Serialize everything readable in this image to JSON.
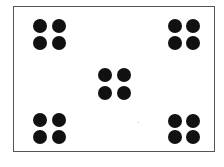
{
  "diagram": {
    "frame_color": "#555555",
    "dot_color": "#111111",
    "clusters": [
      {
        "name": "top-left",
        "dots": [
          [
            40,
            26
          ],
          [
            59,
            26
          ],
          [
            40,
            43
          ],
          [
            59,
            43
          ]
        ]
      },
      {
        "name": "top-right",
        "dots": [
          [
            175,
            26
          ],
          [
            193,
            26
          ],
          [
            175,
            43
          ],
          [
            193,
            43
          ]
        ]
      },
      {
        "name": "center",
        "dots": [
          [
            105,
            75
          ],
          [
            124,
            75
          ],
          [
            105,
            93
          ],
          [
            124,
            93
          ]
        ]
      },
      {
        "name": "bottom-left",
        "dots": [
          [
            40,
            120
          ],
          [
            59,
            120
          ],
          [
            40,
            137
          ],
          [
            59,
            137
          ]
        ]
      },
      {
        "name": "bottom-right",
        "dots": [
          [
            175,
            121
          ],
          [
            193,
            121
          ],
          [
            175,
            137
          ],
          [
            193,
            137
          ]
        ]
      }
    ]
  }
}
